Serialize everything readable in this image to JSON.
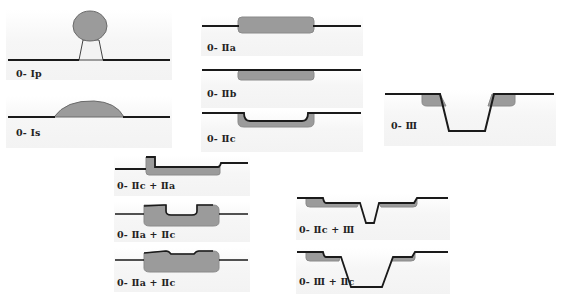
{
  "figure": {
    "colors": {
      "lesion_fill": "#9b9b9b",
      "lesion_stroke": "#7a7a7a",
      "mucosa_line": "#1a1a1a",
      "panel_bg": "#f4f4f4"
    },
    "panels": [
      {
        "id": "0-Ip",
        "label": "0- Ⅰp",
        "description": "Pedunculated"
      },
      {
        "id": "0-Is",
        "label": "0- Ⅰs",
        "description": "Sessile"
      },
      {
        "id": "0-IIa",
        "label": "0- Ⅱa",
        "description": "Slightly elevated"
      },
      {
        "id": "0-IIb",
        "label": "0- Ⅱb",
        "description": "Flat"
      },
      {
        "id": "0-IIc",
        "label": "0- Ⅱc",
        "description": "Slightly depressed"
      },
      {
        "id": "0-III",
        "label": "0- Ⅲ",
        "description": "Excavated"
      },
      {
        "id": "0-IIc+IIa",
        "label": "0- Ⅱc + Ⅱa",
        "description": "Mixed depressed + elevated"
      },
      {
        "id": "0-IIa+IIc-1",
        "label": "0- Ⅱa + Ⅱc",
        "description": "Elevated with central depression"
      },
      {
        "id": "0-IIa+IIc-2",
        "label": "0- Ⅱa + Ⅱc",
        "description": "Elevated with shallow depression"
      },
      {
        "id": "0-IIc+III",
        "label": "0- Ⅱc + Ⅲ",
        "description": "Depressed with ulcer"
      },
      {
        "id": "0-III+IIc",
        "label": "0- Ⅲ + Ⅱc",
        "description": "Ulcer with depressed rim"
      }
    ]
  }
}
